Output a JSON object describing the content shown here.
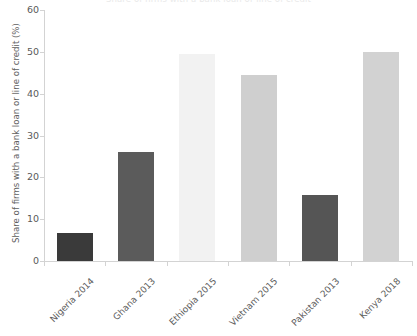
{
  "chart_data": {
    "type": "bar",
    "title": "Share of firms with a bank loan or line of credit",
    "xlabel": "",
    "ylabel": "Share of firms with a bank loan or line of credit (%)",
    "categories": [
      "Nigeria 2014",
      "Ghana 2013",
      "Ethiopia 2015",
      "Vietnam 2015",
      "Pakistan 2013",
      "Kenya 2018"
    ],
    "values": [
      6.6,
      26.1,
      49.5,
      44.5,
      15.8,
      49.9
    ],
    "bar_colors": [
      "#3a3a3a",
      "#5b5b5b",
      "#f2f2f2",
      "#cfcfcf",
      "#555555",
      "#d2d2d2"
    ],
    "ylim": [
      0,
      60
    ],
    "ytick_labels": [
      "0",
      "10",
      "20",
      "30",
      "40",
      "50",
      "60"
    ],
    "ytick_values": [
      0,
      10,
      20,
      30,
      40,
      50,
      60
    ],
    "grid": false,
    "legend": "none",
    "axis_color": "#d3d3d3",
    "text_color": "#5a5a5a"
  }
}
